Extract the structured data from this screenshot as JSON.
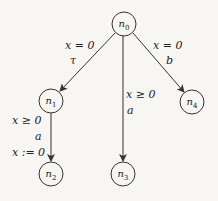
{
  "diagram": {
    "type": "automaton-tree",
    "nodes": [
      {
        "id": "n0",
        "name": "n",
        "sub": "0",
        "cx": 124,
        "cy": 24
      },
      {
        "id": "n1",
        "name": "n",
        "sub": "1",
        "cx": 51,
        "cy": 101
      },
      {
        "id": "n2",
        "name": "n",
        "sub": "2",
        "cx": 51,
        "cy": 174
      },
      {
        "id": "n3",
        "name": "n",
        "sub": "3",
        "cx": 123,
        "cy": 174
      },
      {
        "id": "n4",
        "name": "n",
        "sub": "4",
        "cx": 192,
        "cy": 102
      }
    ],
    "edges": [
      {
        "from": "n0",
        "to": "n1",
        "guard": "x = 0",
        "action": "τ"
      },
      {
        "from": "n0",
        "to": "n3",
        "guard": "x ≥ 0",
        "action": "a"
      },
      {
        "from": "n0",
        "to": "n4",
        "guard": "x = 0",
        "action": "b"
      },
      {
        "from": "n1",
        "to": "n2",
        "guard": "x ≥ 0",
        "action": "a",
        "reset": "x := 0"
      }
    ],
    "colors": {
      "stroke": "#333333",
      "background": "#f7f6f3",
      "text": "#222222"
    }
  }
}
